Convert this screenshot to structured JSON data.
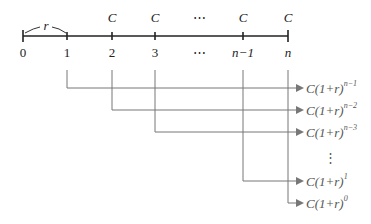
{
  "diagram": {
    "timeline": {
      "ticks": [
        {
          "label": "0",
          "x": 23,
          "payment": ""
        },
        {
          "label": "1",
          "x": 67,
          "payment": ""
        },
        {
          "label": "2",
          "x": 112,
          "payment": "C"
        },
        {
          "label": "3",
          "x": 155,
          "payment": "C"
        },
        {
          "label": "⋯",
          "x": 199,
          "payment": "⋯"
        },
        {
          "label": "n−1",
          "x": 243,
          "payment": "C"
        },
        {
          "label": "n",
          "x": 288,
          "payment": "C"
        }
      ],
      "interval_label": "r"
    },
    "flows": [
      {
        "from_tick": "1",
        "y": 88,
        "formula_base": "C(1+r)",
        "exponent": "n−1"
      },
      {
        "from_tick": "2",
        "y": 110,
        "formula_base": "C(1+r)",
        "exponent": "n−2"
      },
      {
        "from_tick": "3",
        "y": 132,
        "formula_base": "C(1+r)",
        "exponent": "n−3"
      },
      {
        "from_tick": "n−1",
        "y": 181,
        "formula_base": "C(1+r)",
        "exponent": "1"
      },
      {
        "from_tick": "n",
        "y": 203,
        "formula_base": "C(1+r)",
        "exponent": "0"
      }
    ],
    "vertical_ellipsis": "⋮",
    "colors": {
      "axis": "#222222",
      "flow_lines": "#777777",
      "formula_text": "#555555"
    }
  }
}
